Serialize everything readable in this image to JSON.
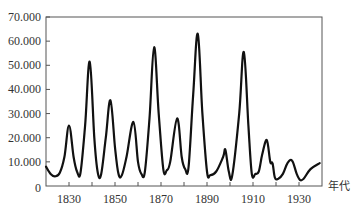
{
  "chart_data": {
    "type": "line",
    "title": "",
    "xlabel": "年代",
    "ylabel": "",
    "xlim": [
      1820,
      1940
    ],
    "ylim": [
      0,
      70000
    ],
    "grid": false,
    "legend": null,
    "x_ticks": [
      1830,
      1850,
      1870,
      1890,
      1910,
      1930
    ],
    "x_minor_ticks": [
      1830,
      1840,
      1850,
      1860,
      1870,
      1880,
      1890,
      1900,
      1910,
      1920,
      1930
    ],
    "y_ticks": [
      0,
      10000,
      20000,
      30000,
      40000,
      50000,
      60000,
      70000
    ],
    "y_tick_labels": [
      "0",
      "10.000",
      "20.000",
      "30.000",
      "40.000",
      "50.000",
      "60.000",
      "70.000"
    ],
    "x_tick_labels": [
      "1830",
      "1850",
      "1870",
      "1890",
      "1910",
      "1930"
    ],
    "series": [
      {
        "name": "",
        "color": "#111111",
        "x": [
          1820,
          1822,
          1824,
          1826,
          1828,
          1830,
          1832,
          1833.5,
          1835,
          1837,
          1839,
          1841,
          1842.5,
          1844,
          1846,
          1848,
          1850,
          1851.5,
          1853,
          1855,
          1858,
          1860,
          1861.5,
          1863,
          1865,
          1867,
          1869,
          1871,
          1872.5,
          1874,
          1877,
          1879,
          1880.5,
          1882,
          1884,
          1886,
          1888,
          1890,
          1891.5,
          1894,
          1897,
          1898,
          1899.5,
          1901,
          1904,
          1906,
          1908,
          1909.5,
          1911,
          1912.5,
          1914,
          1916,
          1917.5,
          1918.5,
          1919.5,
          1921,
          1923,
          1925,
          1927,
          1929,
          1930.5,
          1932,
          1935,
          1939
        ],
        "values": [
          8000,
          5000,
          4000,
          5500,
          12000,
          25000,
          12000,
          6000,
          5500,
          25000,
          51500,
          20000,
          5500,
          5000,
          20000,
          35500,
          16000,
          5000,
          4500,
          12000,
          26500,
          10000,
          5000,
          6000,
          28000,
          57500,
          30000,
          7000,
          6500,
          10000,
          28000,
          12000,
          7000,
          8000,
          38000,
          63000,
          30000,
          6000,
          4500,
          6000,
          12000,
          15000,
          6000,
          4500,
          30000,
          55500,
          25000,
          5000,
          5000,
          6000,
          13000,
          19000,
          10000,
          9500,
          3500,
          3000,
          5000,
          9500,
          10500,
          5000,
          2500,
          3000,
          7000,
          9500
        ]
      }
    ]
  }
}
